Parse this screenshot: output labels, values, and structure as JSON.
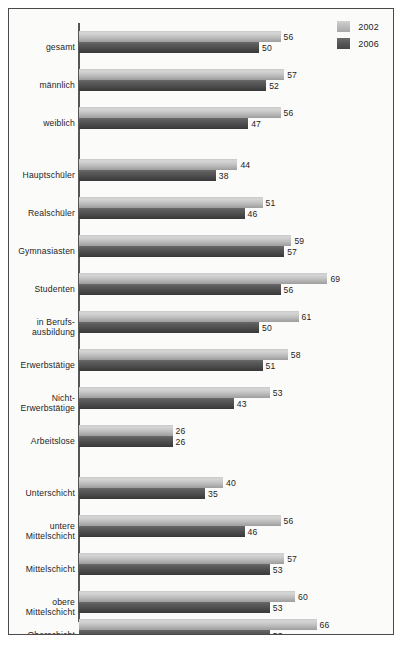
{
  "legend": {
    "items": [
      {
        "label": "2002",
        "color": "#c2c2c2",
        "key": "y2002"
      },
      {
        "label": "2006",
        "color": "#4d4d4d",
        "key": "y2006"
      }
    ]
  },
  "chart_data": {
    "type": "bar",
    "orientation": "horizontal",
    "title": "",
    "xlabel": "",
    "ylabel": "",
    "xlim": [
      0,
      70
    ],
    "grid": false,
    "legend_position": "top-right",
    "categories": [
      "gesamt",
      "männlich",
      "weiblich",
      "Hauptschüler",
      "Realschüler",
      "Gymnasiasten",
      "Studenten",
      "in Berufs-\nausbildung",
      "Erwerbstätige",
      "Nicht-\nErwerbstätige",
      "Arbeitslose",
      "Unterschicht",
      "untere\nMittelschicht",
      "Mittelschicht",
      "obere\nMittelschicht",
      "Oberschicht"
    ],
    "series": [
      {
        "name": "2002",
        "values": [
          56,
          57,
          56,
          44,
          51,
          59,
          69,
          61,
          58,
          53,
          26,
          40,
          56,
          57,
          60,
          66
        ]
      },
      {
        "name": "2006",
        "values": [
          50,
          52,
          47,
          38,
          46,
          57,
          56,
          50,
          51,
          43,
          26,
          35,
          46,
          53,
          53,
          53
        ]
      }
    ]
  },
  "layout": {
    "group_tops": [
      22,
      60,
      98,
      150,
      188,
      226,
      264,
      302,
      340,
      378,
      416,
      468,
      506,
      544,
      582,
      610
    ],
    "px_per_unit": 3.6
  }
}
